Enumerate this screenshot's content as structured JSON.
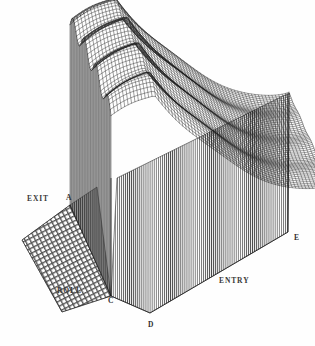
{
  "figure": {
    "type": "3d-wireframe-surface-plot",
    "background_color": "#ffffff",
    "ink_color": "#1a1a1a"
  },
  "labels": {
    "exit": "EXIT",
    "roll": "ROLL",
    "entry": "ENTRY",
    "vertex_a": "A",
    "vertex_c": "C",
    "vertex_d": "D",
    "vertex_e": "E"
  },
  "chart_data": {
    "type": "surface",
    "title": "",
    "xlabel": "ENTRY",
    "ylabel": "ROLL",
    "zlabel": "",
    "annotations": [
      "EXIT",
      "ROLL",
      "ENTRY",
      "A",
      "C",
      "D",
      "E"
    ],
    "grid": true,
    "legend": "none",
    "projection": {
      "kind": "oblique-isometric",
      "vertices": {
        "A": [
          70,
          205
        ],
        "C": [
          111,
          296
        ],
        "D": [
          150,
          313
        ],
        "E": [
          288,
          232
        ],
        "top_back_left": [
          97,
          38
        ],
        "top_back_right": [
          216,
          20
        ],
        "top_front_right": [
          289,
          93
        ],
        "base_far_left": [
          22,
          240
        ]
      }
    },
    "mesh": {
      "u_divisions": 64,
      "v_divisions": 56,
      "ripple_amplitude": 9,
      "ripple_wavelength": 16,
      "ripple_decay": 0.45,
      "plateau_height": 190
    },
    "surface_note": "Height is maximal along the back ridge, oscillates strongly on the exit (left) flank, and falls monotonically to zero along the entry (right) flank."
  }
}
